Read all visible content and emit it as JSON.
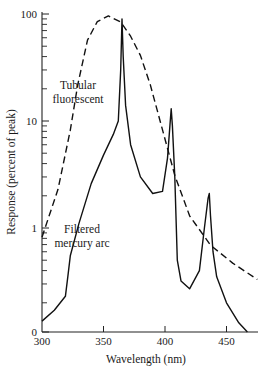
{
  "chart_data": {
    "type": "line",
    "title": "",
    "xlabel": "Wavelength (nm)",
    "ylabel": "Response (percent of peak)",
    "yscale": "log",
    "xlim": [
      300,
      476
    ],
    "ylim": [
      0.1,
      100
    ],
    "grid": false,
    "legend": "none (inline annotations)",
    "x_ticks": [
      300,
      350,
      400,
      450
    ],
    "x_tick_labels": [
      "300",
      "350",
      "400",
      "450"
    ],
    "y_ticks": [
      0.1,
      1,
      10,
      100
    ],
    "y_tick_labels": [
      "0",
      "1",
      "10",
      "100"
    ],
    "series": [
      {
        "name": "Tubular fluorescent",
        "style": "dashed",
        "x": [
          300,
          313,
          323,
          329,
          337,
          345,
          354,
          364,
          372,
          380,
          388,
          396,
          408,
          420,
          437,
          455,
          475
        ],
        "y": [
          0.82,
          2.3,
          8.2,
          21.7,
          57,
          85,
          96,
          84,
          62,
          41,
          22,
          10,
          3.1,
          1.3,
          0.69,
          0.47,
          0.33
        ]
      },
      {
        "name": "Filtered mercury arc",
        "style": "solid",
        "x": [
          300,
          310,
          319,
          321,
          323,
          330,
          340,
          350,
          358,
          362,
          364,
          365,
          366,
          368,
          372,
          380,
          390,
          398,
          402,
          404,
          405,
          406,
          408,
          410,
          413,
          420,
          428,
          432,
          435,
          436,
          437,
          439,
          442,
          450,
          460,
          467
        ],
        "y": [
          0.135,
          0.17,
          0.23,
          0.35,
          0.55,
          1.1,
          2.6,
          4.8,
          7.5,
          10,
          30,
          90,
          40,
          14,
          6,
          3,
          2.1,
          2.2,
          4.5,
          9,
          13,
          9,
          3,
          0.5,
          0.32,
          0.27,
          0.4,
          1.0,
          1.9,
          2.1,
          1.3,
          0.6,
          0.35,
          0.2,
          0.13,
          0.1
        ]
      }
    ],
    "annotations": [
      {
        "text": [
          "Tubular",
          "fluorescent"
        ],
        "points_to": "Tubular fluorescent"
      },
      {
        "text": [
          "Filtered",
          "mercury arc"
        ],
        "points_to": "Filtered mercury arc"
      }
    ]
  },
  "labels": {
    "xlabel": "Wavelength (nm)",
    "ylabel": "Response (percent of peak)",
    "annot_fluor_1": "Tubular",
    "annot_fluor_2": "fluorescent",
    "annot_hg_1": "Filtered",
    "annot_hg_2": "mercury arc"
  }
}
